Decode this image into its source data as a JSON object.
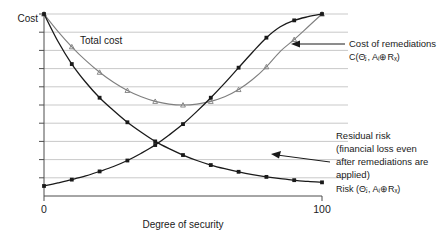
{
  "chart_data": {
    "type": "line",
    "title": "",
    "xlabel": "Degree of security",
    "ylabel": "Cost",
    "xlim": [
      0,
      100
    ],
    "ylim": [
      0,
      10
    ],
    "grid": true,
    "grid_lines": 10,
    "legend_position": "inline-annotations",
    "xticks": [
      "0",
      "100"
    ],
    "yticks": [],
    "x": [
      0,
      5,
      10,
      15,
      20,
      25,
      30,
      35,
      40,
      45,
      50,
      55,
      60,
      65,
      70,
      75,
      80,
      85,
      90,
      95,
      100
    ],
    "series": [
      {
        "name": "Total cost",
        "color": "#7f7f7f",
        "marker": "triangle",
        "values": [
          10.0,
          9.05,
          8.2,
          7.45,
          6.8,
          6.25,
          5.8,
          5.45,
          5.2,
          5.05,
          5.0,
          5.05,
          5.2,
          5.45,
          5.85,
          6.4,
          7.1,
          7.95,
          8.6,
          9.3,
          10.0
        ]
      },
      {
        "name": "Cost of remediations",
        "color": "#1a1a1a",
        "marker": "square",
        "values": [
          0.55,
          0.72,
          0.9,
          1.1,
          1.35,
          1.62,
          1.95,
          2.35,
          2.8,
          3.35,
          3.95,
          4.65,
          5.4,
          6.2,
          7.05,
          7.9,
          8.7,
          9.3,
          9.65,
          9.85,
          10.0
        ]
      },
      {
        "name": "Residual risk",
        "color": "#1a1a1a",
        "marker": "square",
        "values": [
          10.0,
          8.5,
          7.25,
          6.25,
          5.4,
          4.7,
          4.05,
          3.5,
          3.0,
          2.6,
          2.25,
          1.95,
          1.7,
          1.5,
          1.33,
          1.18,
          1.05,
          0.95,
          0.87,
          0.8,
          0.75
        ]
      }
    ],
    "annotations": [
      {
        "name": "total-cost",
        "text": "Total cost",
        "x": 10,
        "y": 8.6
      },
      {
        "name": "cost-of-remediations",
        "line1": "Cost of remediations",
        "line2": "C(Θⱼ, Aᵢ⊕Rₓ)",
        "arrow_to_x": 93,
        "arrow_to_y": 8.4
      },
      {
        "name": "residual-risk",
        "line1": "Residual risk",
        "line2": "(financial loss even",
        "line3": "after remediations are",
        "line4": "applied)",
        "line5": "Risk (Θⱼ, Aᵢ⊕Rₓ)",
        "arrow_to_x": 92,
        "arrow_to_y": 1.0
      }
    ],
    "colors": {
      "grid": "#c9c9c9",
      "axis": "#4d4d4d",
      "total_cost": "#7f7f7f",
      "remediation": "#1a1a1a",
      "risk": "#1a1a1a",
      "background": "#ffffff",
      "text": "#1a1a1a"
    }
  },
  "axes": {
    "y_axis_label": "Cost",
    "x_axis_label": "Degree of security",
    "x_tick_min": "0",
    "x_tick_max": "100"
  },
  "labels": {
    "total_cost": "Total cost",
    "remediation_line1": "Cost of remediations",
    "remediation_line2": "C(Θⱼ, Aᵢ⊕Rₓ)",
    "risk_line1": "Residual risk",
    "risk_line2": "(financial loss even",
    "risk_line3": "after remediations are",
    "risk_line4": "applied)",
    "risk_line5": "Risk (Θⱼ, Aᵢ⊕Rₓ)"
  }
}
